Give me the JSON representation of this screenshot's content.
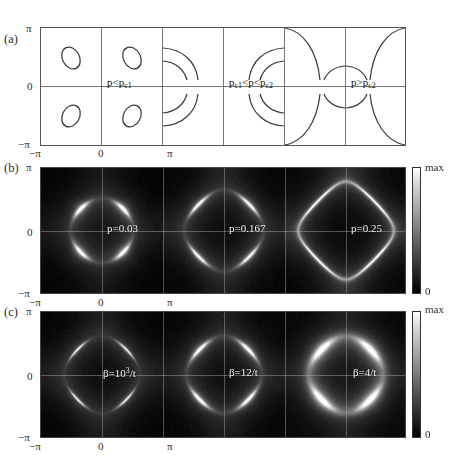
{
  "figure": {
    "panels": [
      {
        "tag": "(a)",
        "type": "contour",
        "inner_labels": [
          "p<p c1",
          "p c1<p<p c2",
          "p>p c2"
        ]
      },
      {
        "tag": "(b)",
        "type": "intensity-map",
        "inner_labels": [
          "p=0.03",
          "p=0.167",
          "p=0.25"
        ]
      },
      {
        "tag": "(c)",
        "type": "intensity-map",
        "inner_labels": [
          "β=10³/t",
          "β=12/t",
          "β=4/t"
        ]
      }
    ]
  },
  "panel_a": {
    "tag": "(a)",
    "y_ticks": [
      "π",
      "0",
      "−π"
    ],
    "x_ticks": [
      "−π",
      "0",
      "π"
    ],
    "label1_main": "p<p",
    "label1_sub": "c1",
    "label2_a": "p",
    "label2_sub_a": "c1",
    "label2_mid": "<p<p",
    "label2_sub_b": "c2",
    "label3_main": "p>p",
    "label3_sub": "c2"
  },
  "panel_b": {
    "tag": "(b)",
    "y_ticks": [
      "π",
      "0",
      "−π"
    ],
    "x_ticks": [
      "−π",
      "0",
      "π"
    ],
    "labels": [
      "p=0.03",
      "p=0.167",
      "p=0.25"
    ],
    "cbar_max": "max",
    "cbar_min": "0"
  },
  "panel_c": {
    "tag": "(c)",
    "y_ticks": [
      "π",
      "0",
      "−π"
    ],
    "x_ticks": [
      "−π",
      "0",
      "π"
    ],
    "label1_beta": "β=10",
    "label1_exp": "3",
    "label1_tail": "/t",
    "label2": "β=12/t",
    "label3": "β=4/t",
    "cbar_max": "max",
    "cbar_min": "0"
  },
  "chart_data": {
    "type": "heatmap",
    "title": "",
    "xlabel": "",
    "ylabel": "",
    "xlim": [
      -3.14159,
      3.14159
    ],
    "ylim": [
      -3.14159,
      3.14159
    ],
    "grid": true,
    "legend_position": "right",
    "colorbar": {
      "min_label": "0",
      "max_label": "max",
      "min_color": "#000000",
      "max_color": "#ffffff"
    },
    "panels": [
      {
        "tag": "(a)",
        "kind": "contour",
        "description": "Fermi-surface contours in the Brillouin zone, doping evolution",
        "cells": [
          {
            "label": "",
            "regime": "p<p_c1",
            "feature": "small closed hole pockets",
            "pocket_tilt_deg": -25
          },
          {
            "label": "p<p c1",
            "regime": "p<p_c1",
            "feature": "small closed hole pockets",
            "pocket_tilt_deg": -25
          },
          {
            "label": "",
            "regime": "p_c1<p<p_c2",
            "feature": "open arcs near zone corners"
          },
          {
            "label": "p c1<p<p c2",
            "regime": "p_c1<p<p_c2",
            "feature": "open arcs near zone corners"
          },
          {
            "label": "",
            "regime": "p>p_c2",
            "feature": "large open hole-like surface"
          },
          {
            "label": "p>p c2",
            "regime": "p>p_c2",
            "feature": "large open hole-like surface"
          }
        ]
      },
      {
        "tag": "(b)",
        "kind": "heatmap",
        "description": "Spectral intensity A(k) vs doping p",
        "cells": [
          {
            "label": "p=0.03",
            "parameter": "p",
            "value": 0.03,
            "feature": "bright compact nodal pockets"
          },
          {
            "label": "p=0.167",
            "parameter": "p",
            "value": 0.167,
            "feature": "extended bright arcs"
          },
          {
            "label": "p=0.25",
            "parameter": "p",
            "value": 0.25,
            "feature": "continuous large contour"
          }
        ]
      },
      {
        "tag": "(c)",
        "kind": "heatmap",
        "description": "Spectral intensity A(k) vs inverse temperature β",
        "cells": [
          {
            "label": "β=10³/t",
            "parameter": "beta",
            "value": 1000,
            "unit": "1/t",
            "feature": "sharp thin arcs"
          },
          {
            "label": "β=12/t",
            "parameter": "beta",
            "value": 12,
            "unit": "1/t",
            "feature": "broadened arcs"
          },
          {
            "label": "β=4/t",
            "parameter": "beta",
            "value": 4,
            "unit": "1/t",
            "feature": "heavily broadened diffuse contour"
          }
        ]
      }
    ]
  }
}
